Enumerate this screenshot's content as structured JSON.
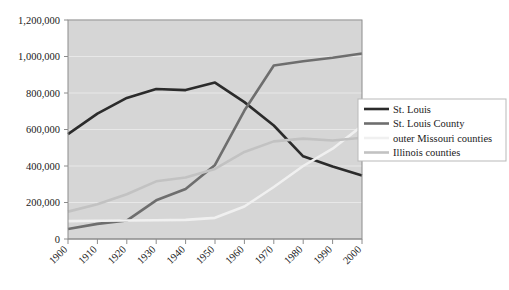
{
  "chart_data": {
    "type": "line",
    "title": "",
    "subtitle": "",
    "xlabel": "",
    "ylabel": "",
    "x": [
      1900,
      1910,
      1920,
      1930,
      1940,
      1950,
      1960,
      1970,
      1980,
      1990,
      2000
    ],
    "categories": [
      "1900",
      "1910",
      "1920",
      "1930",
      "1940",
      "1950",
      "1960",
      "1970",
      "1980",
      "1990",
      "2000"
    ],
    "xlim": [
      1900,
      2000
    ],
    "ylim": [
      0,
      1200000
    ],
    "ytick_values": [
      0,
      200000,
      400000,
      600000,
      800000,
      1000000,
      1200000
    ],
    "ytick_labels": [
      "0",
      "200,000",
      "400,000",
      "600,000",
      "800,000",
      "1,000,000",
      "1,200,000"
    ],
    "grid": true,
    "legend_position": "right",
    "plot_background": "#d6d6d6",
    "gridline_color": "#e8e8e8",
    "series": [
      {
        "name": "St. Louis",
        "color": "#2b2b2b",
        "width": 2.6,
        "values": [
          575000,
          687000,
          773000,
          822000,
          816000,
          857000,
          750000,
          622000,
          453000,
          397000,
          348000
        ]
      },
      {
        "name": "St. Louis County",
        "color": "#6e6e6e",
        "width": 2.6,
        "values": [
          55000,
          83000,
          101000,
          212000,
          274000,
          406000,
          704000,
          951000,
          974000,
          993000,
          1016000
        ]
      },
      {
        "name": "outer Missouri counties",
        "color": "#f0f0f0",
        "width": 2.6,
        "values": [
          98000,
          100000,
          101000,
          103000,
          105000,
          116000,
          178000,
          285000,
          400000,
          495000,
          620000
        ]
      },
      {
        "name": "Illinois counties",
        "color": "#c2c2c2",
        "width": 2.6,
        "values": [
          150000,
          190000,
          245000,
          316000,
          337000,
          384000,
          477000,
          535000,
          550000,
          540000,
          555000
        ]
      }
    ]
  },
  "legend": {
    "entries": [
      {
        "label": "St. Louis"
      },
      {
        "label": "St. Louis County"
      },
      {
        "label": "outer Missouri counties"
      },
      {
        "label": "Illinois counties"
      }
    ]
  }
}
